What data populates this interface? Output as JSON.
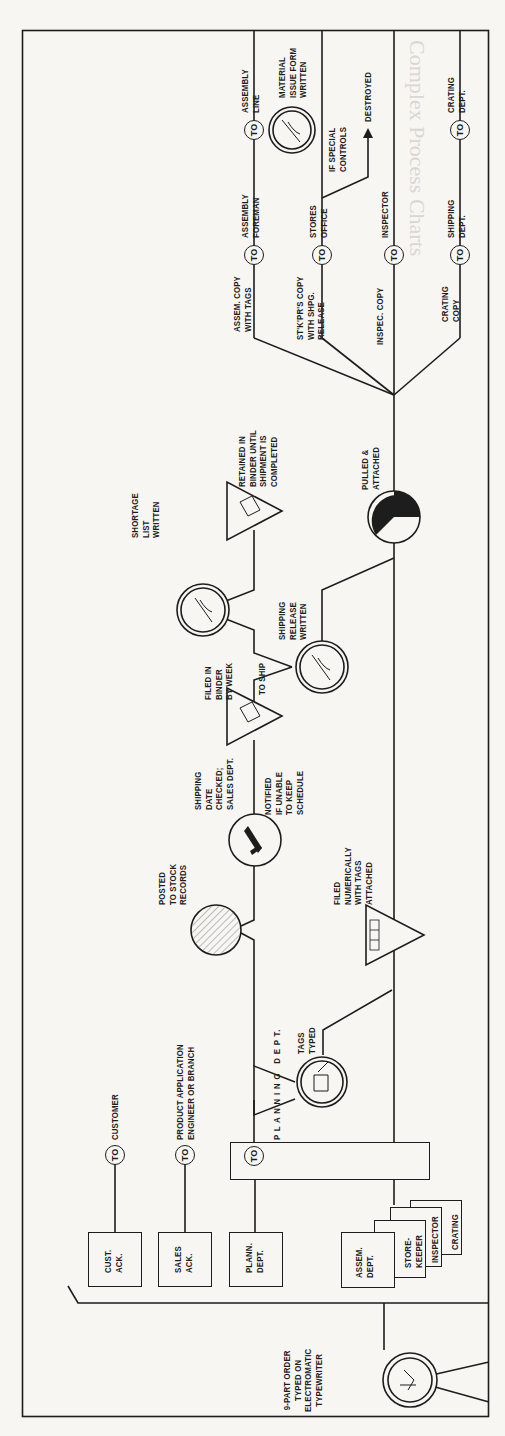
{
  "document": {
    "bleed_through_heading": "Complex Process Charts",
    "chart_type": "flow process chart (rotated)"
  },
  "chart": {
    "start": {
      "label": "9-PART ORDER\nTYPED ON\nELECTROMATIC\nTYPEWRITER"
    },
    "distribution_copies": [
      {
        "label": "CUST.\nACK.",
        "to": "CUSTOMER"
      },
      {
        "label": "SALES\nACK.",
        "to": "PRODUCT APPLICATION\nENGINEER OR BRANCH"
      },
      {
        "label": "PLANN.\nDEPT.",
        "to": "PLANNING DEPT."
      }
    ],
    "stacked_copies": [
      "ASSEM.\nDEPT.",
      "STORE-\nKEEPER",
      "INSPECTOR",
      "CRATING"
    ],
    "planning_box": {
      "to": "TO",
      "label": "P L A N N I N G   D E P T."
    },
    "steps": {
      "tags_typed": "TAGS\nTYPED",
      "filed_numerically": "FILED\nNUMERICALLY\nWITH TAGS\nATTACHED",
      "tag_numbers": [
        "1",
        "2",
        "3"
      ],
      "posted_to_stock": "POSTED\nTO STOCK\nRECORDS",
      "shipping_date": "SHIPPING\nDATE\nCHECKED;\nSALES DEPT.",
      "notified": "NOTIFIED\nIF UNABLE\nTO KEEP\nSCHEDULE",
      "filed_binder": "FILED IN\nBINDER\nBY WEEK",
      "to_ship": "TO SHIP",
      "shipping_release": "SHIPPING\nRELEASE\nWRITTEN",
      "shortage_list": "SHORTAGE\nLIST\nWRITTEN",
      "retained": "RETAINED IN\nBINDER UNTIL\nSHIPMENT IS\nCOMPLETED",
      "pulled": "PULLED &\nATTACHED"
    },
    "branches": [
      {
        "copy": "ASSEM. COPY\nWITH TAGS",
        "to": "ASSEMBLY\nFOREMAN"
      },
      {
        "copy": "ST'K'PR'S COPY\nWITH SHPG.\nRELEASE",
        "to": "STORES\nOFFICE"
      },
      {
        "copy": "INSPEC. COPY",
        "to": "INSPECTOR"
      },
      {
        "copy": "CRATING\nCOPY",
        "to": "SHIPPING\nDEPT."
      }
    ],
    "final": {
      "to_assembly_line": "ASSEMBLY\nLINE",
      "material_issue": "MATERIAL\nISSUE FORM\nWRITTEN",
      "special_controls": "IF SPECIAL\nCONTROLS",
      "destroyed": "DESTROYED",
      "to_crating": "CRATING\nDEPT."
    },
    "to_label": "TO"
  },
  "colors": {
    "paper": "#f7f6f3",
    "ink": "#1d1d1d",
    "bleed": "#d9d7d2"
  }
}
